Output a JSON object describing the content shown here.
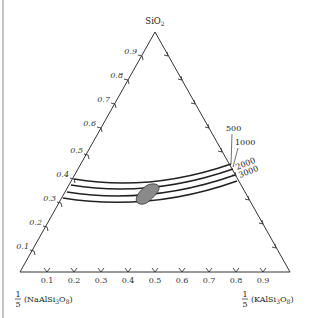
{
  "diagram": {
    "type": "ternary",
    "vertices": {
      "top": {
        "label": "SiO",
        "sub": "2"
      },
      "left": {
        "fraction_num": "1",
        "fraction_den": "5",
        "label_parts": [
          "(NaAlSi",
          "3",
          "O",
          "8",
          ")"
        ]
      },
      "right": {
        "fraction_num": "1",
        "fraction_den": "5",
        "label_parts": [
          "(KAlSi",
          "3",
          "O",
          "8",
          ")"
        ]
      }
    },
    "left_axis_ticks": [
      "0.1",
      "0.2",
      "0.3",
      "0.4",
      "0.5",
      "0.6",
      "0.7",
      "0.8",
      "0.9"
    ],
    "bottom_axis_ticks": [
      "0.1",
      "0.2",
      "0.3",
      "0.4",
      "0.5",
      "0.6",
      "0.7",
      "0.8",
      "0.9"
    ],
    "curves": [
      {
        "label": "500"
      },
      {
        "label": "1000"
      },
      {
        "label": "2000"
      },
      {
        "label": "3000"
      }
    ],
    "shaded_region": {
      "color": "#8a8a8a"
    },
    "line_color": "#222222"
  }
}
